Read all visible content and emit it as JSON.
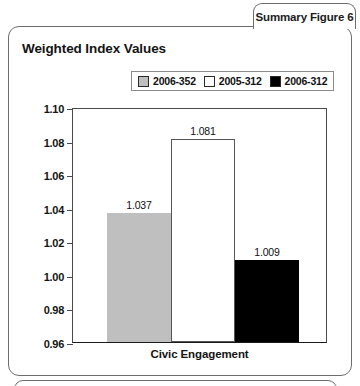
{
  "tab": {
    "label": "Summary Figure 6"
  },
  "panel": {
    "title": "Weighted Index Values"
  },
  "chart_data": {
    "type": "bar",
    "title": "Weighted Index Values",
    "xlabel": "Civic Engagement",
    "ylabel": "",
    "categories": [
      "Civic Engagement"
    ],
    "ylim": [
      0.96,
      1.1
    ],
    "ytick_labels": [
      "1.10",
      "1.08",
      "1.06",
      "1.04",
      "1.02",
      "1.00",
      "0.98",
      "0.96"
    ],
    "ytick_values": [
      1.1,
      1.08,
      1.06,
      1.04,
      1.02,
      1.0,
      0.98,
      0.96
    ],
    "grid": false,
    "legend_position": "top-right",
    "series": [
      {
        "name": "2006-352",
        "color": "#bfbfbf",
        "values": [
          1.037
        ],
        "value_labels": [
          "1.037"
        ]
      },
      {
        "name": "2005-312",
        "color": "#ffffff",
        "values": [
          1.081
        ],
        "value_labels": [
          "1.081"
        ]
      },
      {
        "name": "2006-312",
        "color": "#000000",
        "values": [
          1.009
        ],
        "value_labels": [
          "1.009"
        ]
      }
    ]
  }
}
